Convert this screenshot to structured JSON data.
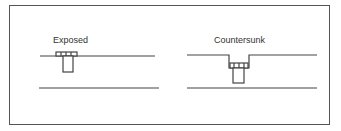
{
  "diagram": {
    "panels": [
      {
        "id": "exposed",
        "label": "Exposed"
      },
      {
        "id": "countersunk",
        "label": "Countersunk"
      }
    ],
    "colors": {
      "frame": "#555555",
      "line": "#444444",
      "background": "#ffffff"
    }
  }
}
